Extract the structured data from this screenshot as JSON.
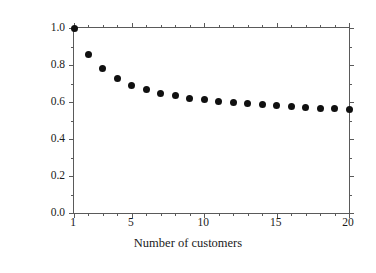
{
  "chart_data": {
    "type": "scatter",
    "title": "",
    "xlabel": "Number of customers",
    "ylabel": "Coincident factor",
    "xlim": [
      1,
      20
    ],
    "ylim": [
      0.0,
      1.0
    ],
    "grid": false,
    "legend": null,
    "marker": "filled-circle",
    "marker_color": "#101010",
    "axis_color": "#5a5a5a",
    "background": "#ffffff",
    "xticks": [
      1,
      5,
      10,
      15,
      20
    ],
    "xtick_labels": [
      "1",
      "5",
      "10",
      "15",
      "20"
    ],
    "xminor_ticks": [
      2,
      3,
      4,
      6,
      7,
      8,
      9,
      11,
      12,
      13,
      14,
      16,
      17,
      18,
      19
    ],
    "yticks": [
      0.0,
      0.2,
      0.4,
      0.6,
      0.8,
      1.0
    ],
    "ytick_labels": [
      "0.0",
      "0.2",
      "0.4",
      "0.6",
      "0.8",
      "1.0"
    ],
    "yminor_ticks": [
      0.1,
      0.3,
      0.5,
      0.7,
      0.9
    ],
    "x": [
      1,
      2,
      3,
      4,
      5,
      6,
      7,
      8,
      9,
      10,
      11,
      12,
      13,
      14,
      15,
      16,
      17,
      18,
      19,
      20
    ],
    "values": [
      1.0,
      0.855,
      0.78,
      0.725,
      0.69,
      0.665,
      0.648,
      0.633,
      0.621,
      0.611,
      0.603,
      0.596,
      0.59,
      0.585,
      0.58,
      0.575,
      0.571,
      0.567,
      0.563,
      0.56
    ],
    "points": [
      {
        "x": 1,
        "y": 1.0
      },
      {
        "x": 2,
        "y": 0.855
      },
      {
        "x": 3,
        "y": 0.78
      },
      {
        "x": 4,
        "y": 0.725
      },
      {
        "x": 5,
        "y": 0.69
      },
      {
        "x": 6,
        "y": 0.665
      },
      {
        "x": 7,
        "y": 0.648
      },
      {
        "x": 8,
        "y": 0.633
      },
      {
        "x": 9,
        "y": 0.621
      },
      {
        "x": 10,
        "y": 0.611
      },
      {
        "x": 11,
        "y": 0.603
      },
      {
        "x": 12,
        "y": 0.596
      },
      {
        "x": 13,
        "y": 0.59
      },
      {
        "x": 14,
        "y": 0.585
      },
      {
        "x": 15,
        "y": 0.58
      },
      {
        "x": 16,
        "y": 0.575
      },
      {
        "x": 17,
        "y": 0.571
      },
      {
        "x": 18,
        "y": 0.567
      },
      {
        "x": 19,
        "y": 0.563
      },
      {
        "x": 20,
        "y": 0.56
      }
    ]
  }
}
